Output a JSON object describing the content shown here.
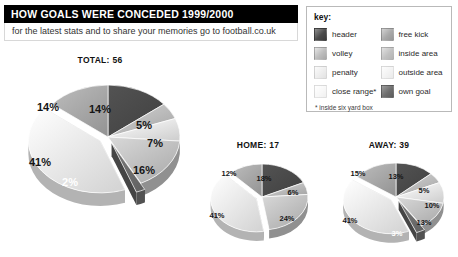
{
  "header": {
    "title": "HOW GOALS WERE CONCEDED 1999/2000",
    "subtitle": "for the latest stats and to share your memories go to football.co.uk"
  },
  "legend": {
    "title": "key:",
    "footnote": "* inside six yard box",
    "items": [
      {
        "label": "header",
        "swatch": "sw-header",
        "color": "#4a4a4a"
      },
      {
        "label": "free kick",
        "swatch": "sw-freekick",
        "color": "#a9a9a9"
      },
      {
        "label": "volley",
        "swatch": "sw-volley",
        "color": "#bdbdbd"
      },
      {
        "label": "inside area",
        "swatch": "sw-insidearea",
        "color": "#c2c2c2"
      },
      {
        "label": "penalty",
        "swatch": "sw-penalty",
        "color": "#ececec"
      },
      {
        "label": "outside area",
        "swatch": "sw-outsidearea",
        "color": "#f2f2f2"
      },
      {
        "label": "close range*",
        "swatch": "sw-closerange",
        "color": "#f7f7f7"
      },
      {
        "label": "own goal",
        "swatch": "sw-owngoal",
        "color": "#6f6f6f"
      }
    ]
  },
  "chart_data": [
    {
      "type": "pie",
      "title": "TOTAL: 56",
      "name": "total",
      "total": 56,
      "categories": [
        "header",
        "volley",
        "penalty",
        "inside area",
        "own goal",
        "outside area",
        "free kick"
      ],
      "values": [
        14,
        5,
        7,
        16,
        2,
        41,
        14
      ],
      "labels": [
        "14%",
        "5%",
        "7%",
        "16%",
        "2%",
        "41%",
        "14%"
      ],
      "exploded": [
        "own goal",
        "outside area"
      ],
      "legend_position": "top-right"
    },
    {
      "type": "pie",
      "title": "HOME: 17",
      "name": "home",
      "total": 17,
      "categories": [
        "header",
        "volley",
        "inside area",
        "outside area",
        "free kick"
      ],
      "values": [
        18,
        6,
        24,
        41,
        12
      ],
      "labels": [
        "18%",
        "6%",
        "24%",
        "41%",
        "12%"
      ],
      "exploded": [
        "outside area"
      ],
      "legend_position": "top-right"
    },
    {
      "type": "pie",
      "title": "AWAY: 39",
      "name": "away",
      "total": 39,
      "categories": [
        "header",
        "volley",
        "penalty",
        "inside area",
        "own goal",
        "outside area",
        "free kick"
      ],
      "values": [
        13,
        5,
        10,
        13,
        3,
        41,
        15
      ],
      "labels": [
        "13%",
        "5%",
        "10%",
        "13%",
        "3%",
        "41%",
        "15%"
      ],
      "exploded": [
        "own goal",
        "outside area"
      ],
      "legend_position": "top-right"
    }
  ]
}
